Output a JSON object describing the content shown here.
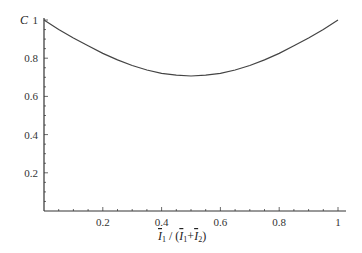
{
  "chart_data": {
    "type": "line",
    "title": "",
    "xlabel": "Ī₁ / (Ī₁+Ī₂)",
    "ylabel": "C",
    "xlim": [
      0,
      1
    ],
    "ylim": [
      0,
      1
    ],
    "xticks": [
      0.2,
      0.4,
      0.6,
      0.8,
      1
    ],
    "xtick_labels": [
      "0.2",
      "0.4",
      "0.6",
      "0.8",
      "1"
    ],
    "yticks": [
      0.2,
      0.4,
      0.6,
      0.8,
      1
    ],
    "ytick_labels": [
      "0.2",
      "0.4",
      "0.6",
      "0.8",
      "1"
    ],
    "grid": false,
    "legend": null,
    "series": [
      {
        "name": "C",
        "x": [
          0,
          0.05,
          0.1,
          0.15,
          0.2,
          0.25,
          0.3,
          0.35,
          0.4,
          0.45,
          0.5,
          0.55,
          0.6,
          0.65,
          0.7,
          0.75,
          0.8,
          0.85,
          0.9,
          0.95,
          1
        ],
        "y": [
          1.0,
          0.951,
          0.906,
          0.865,
          0.825,
          0.791,
          0.762,
          0.738,
          0.721,
          0.711,
          0.707,
          0.711,
          0.721,
          0.738,
          0.762,
          0.791,
          0.825,
          0.865,
          0.906,
          0.951,
          1.0
        ]
      }
    ]
  },
  "axes": {
    "y_label": "C",
    "x_label_parts": {
      "num": "I",
      "num_sub": "1",
      "slash": " / (",
      "d1": "I",
      "d1_sub": "1",
      "plus": "+",
      "d2": "I",
      "d2_sub": "2",
      "close": ")"
    }
  }
}
